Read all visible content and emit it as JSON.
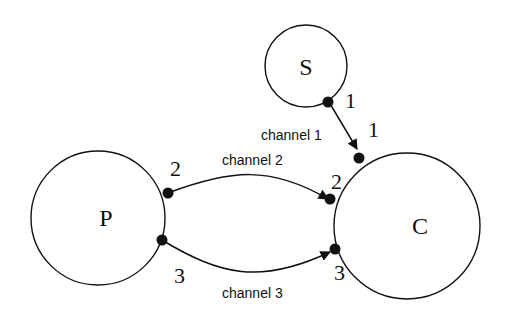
{
  "nodes": {
    "S": {
      "label": "S"
    },
    "P": {
      "label": "P"
    },
    "C": {
      "label": "C"
    }
  },
  "ports": {
    "s1": "1",
    "c1": "1",
    "p2": "2",
    "c2": "2",
    "p3": "3",
    "c3": "3"
  },
  "channels": [
    {
      "label": "channel 1",
      "from": "S port 1",
      "to": "C port 1"
    },
    {
      "label": "channel 2",
      "from": "P port 2",
      "to": "C port 2"
    },
    {
      "label": "channel 3",
      "from": "P port 3",
      "to": "C port 3"
    }
  ]
}
